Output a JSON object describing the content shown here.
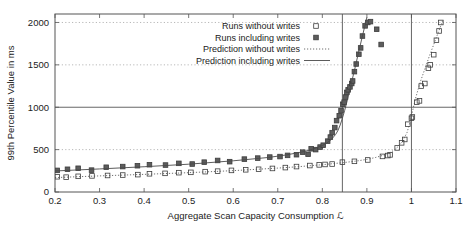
{
  "chart_data": {
    "type": "scatter",
    "title": "",
    "xlabel": "Aggregate Scan Capacity Consumption ℒ",
    "ylabel": "99th Percentile Value in ms",
    "xlim": [
      0.2,
      1.1
    ],
    "ylim": [
      0,
      2100
    ],
    "xticks": [
      "0.2",
      "0.3",
      "0.4",
      "0.5",
      "0.6",
      "0.7",
      "0.8",
      "0.9",
      "1",
      "1.1"
    ],
    "xtick_values": [
      0.2,
      0.3,
      0.4,
      0.5,
      0.6,
      0.7,
      0.8,
      0.9,
      1.0,
      1.1
    ],
    "yticks": [
      "0",
      "500",
      "1000",
      "1500",
      "2000"
    ],
    "ytick_values": [
      0,
      500,
      1000,
      1500,
      2000
    ],
    "grid": "dotted horizontal gridlines at 500, 1500, 2000; solid reference line at 1000",
    "gridlines_dotted": [
      500,
      1500,
      2000
    ],
    "gridlines_solid": [
      1000
    ],
    "vertical_reference_lines": [
      0.845,
      1.0
    ],
    "legend_position": "top-center-right",
    "legend": [
      {
        "label": "Runs without writes",
        "marker": "open-square"
      },
      {
        "label": "Runs including writes",
        "marker": "filled-square"
      },
      {
        "label": "Prediction without writes",
        "marker": "dotted-line"
      },
      {
        "label": "Prediction including writes",
        "marker": "solid-line"
      }
    ],
    "series": [
      {
        "name": "Runs without writes",
        "marker": "open-square",
        "points": [
          [
            0.205,
            180
          ],
          [
            0.225,
            175
          ],
          [
            0.252,
            185
          ],
          [
            0.283,
            190
          ],
          [
            0.318,
            195
          ],
          [
            0.352,
            200
          ],
          [
            0.386,
            205
          ],
          [
            0.412,
            215
          ],
          [
            0.447,
            220
          ],
          [
            0.478,
            228
          ],
          [
            0.505,
            232
          ],
          [
            0.537,
            240
          ],
          [
            0.565,
            246
          ],
          [
            0.596,
            255
          ],
          [
            0.628,
            262
          ],
          [
            0.657,
            268
          ],
          [
            0.688,
            278
          ],
          [
            0.717,
            288
          ],
          [
            0.742,
            300
          ],
          [
            0.772,
            312
          ],
          [
            0.793,
            320
          ],
          [
            0.806,
            325
          ],
          [
            0.822,
            330
          ],
          [
            0.845,
            352
          ],
          [
            0.872,
            362
          ],
          [
            0.902,
            378
          ],
          [
            0.935,
            420
          ],
          [
            0.947,
            430
          ],
          [
            0.952,
            438
          ],
          [
            0.968,
            520
          ],
          [
            0.978,
            580
          ],
          [
            0.985,
            620
          ],
          [
            0.992,
            800
          ],
          [
            1.0,
            870
          ],
          [
            1.002,
            885
          ],
          [
            1.012,
            1060
          ],
          [
            1.018,
            1075
          ],
          [
            1.022,
            1250
          ],
          [
            1.03,
            1280
          ],
          [
            1.038,
            1460
          ],
          [
            1.042,
            1500
          ],
          [
            1.05,
            1620
          ],
          [
            1.056,
            1790
          ],
          [
            1.062,
            1900
          ],
          [
            1.066,
            2000
          ]
        ]
      },
      {
        "name": "Runs including writes",
        "marker": "filled-square",
        "points": [
          [
            0.205,
            255
          ],
          [
            0.228,
            268
          ],
          [
            0.252,
            280
          ],
          [
            0.282,
            258
          ],
          [
            0.315,
            292
          ],
          [
            0.352,
            300
          ],
          [
            0.385,
            310
          ],
          [
            0.412,
            322
          ],
          [
            0.448,
            318
          ],
          [
            0.478,
            338
          ],
          [
            0.508,
            330
          ],
          [
            0.535,
            352
          ],
          [
            0.565,
            372
          ],
          [
            0.592,
            358
          ],
          [
            0.625,
            388
          ],
          [
            0.655,
            400
          ],
          [
            0.682,
            412
          ],
          [
            0.705,
            418
          ],
          [
            0.722,
            432
          ],
          [
            0.742,
            440
          ],
          [
            0.756,
            470
          ],
          [
            0.768,
            445
          ],
          [
            0.775,
            510
          ],
          [
            0.785,
            500
          ],
          [
            0.795,
            530
          ],
          [
            0.802,
            552
          ],
          [
            0.812,
            600
          ],
          [
            0.818,
            648
          ],
          [
            0.822,
            700
          ],
          [
            0.828,
            760
          ],
          [
            0.832,
            842
          ],
          [
            0.838,
            900
          ],
          [
            0.842,
            960
          ],
          [
            0.846,
            1035
          ],
          [
            0.849,
            1060
          ],
          [
            0.852,
            1120
          ],
          [
            0.855,
            1175
          ],
          [
            0.858,
            1205
          ],
          [
            0.862,
            1240
          ],
          [
            0.866,
            1280
          ],
          [
            0.868,
            1310
          ],
          [
            0.872,
            1420
          ],
          [
            0.876,
            1510
          ],
          [
            0.882,
            1625
          ],
          [
            0.886,
            1700
          ],
          [
            0.89,
            1840
          ],
          [
            0.896,
            1960
          ],
          [
            0.902,
            2000
          ],
          [
            0.908,
            2010
          ],
          [
            0.922,
            1920
          ],
          [
            0.932,
            1740
          ]
        ]
      },
      {
        "name": "Prediction without writes",
        "marker": "dotted-line",
        "curve": [
          [
            0.2,
            170
          ],
          [
            0.3,
            190
          ],
          [
            0.4,
            208
          ],
          [
            0.5,
            228
          ],
          [
            0.6,
            252
          ],
          [
            0.7,
            282
          ],
          [
            0.75,
            300
          ],
          [
            0.8,
            322
          ],
          [
            0.85,
            348
          ],
          [
            0.88,
            368
          ],
          [
            0.9,
            385
          ],
          [
            0.92,
            408
          ],
          [
            0.94,
            438
          ],
          [
            0.95,
            460
          ],
          [
            0.96,
            490
          ],
          [
            0.97,
            535
          ],
          [
            0.98,
            600
          ],
          [
            0.99,
            700
          ],
          [
            0.995,
            790
          ],
          [
            1.0,
            900
          ],
          [
            1.01,
            1120
          ],
          [
            1.02,
            1300
          ],
          [
            1.03,
            1450
          ],
          [
            1.04,
            1600
          ],
          [
            1.05,
            1740
          ],
          [
            1.06,
            1880
          ],
          [
            1.07,
            2020
          ]
        ]
      },
      {
        "name": "Prediction including writes",
        "marker": "solid-line",
        "curve": [
          [
            0.2,
            248
          ],
          [
            0.3,
            272
          ],
          [
            0.4,
            298
          ],
          [
            0.5,
            328
          ],
          [
            0.6,
            368
          ],
          [
            0.68,
            408
          ],
          [
            0.72,
            438
          ],
          [
            0.76,
            478
          ],
          [
            0.78,
            508
          ],
          [
            0.8,
            548
          ],
          [
            0.81,
            578
          ],
          [
            0.82,
            618
          ],
          [
            0.83,
            680
          ],
          [
            0.835,
            725
          ],
          [
            0.84,
            790
          ],
          [
            0.845,
            870
          ],
          [
            0.85,
            960
          ],
          [
            0.855,
            1060
          ],
          [
            0.86,
            1170
          ],
          [
            0.865,
            1280
          ],
          [
            0.87,
            1390
          ],
          [
            0.875,
            1500
          ],
          [
            0.88,
            1620
          ],
          [
            0.885,
            1730
          ],
          [
            0.89,
            1840
          ],
          [
            0.895,
            1950
          ],
          [
            0.9,
            2060
          ]
        ]
      }
    ]
  }
}
